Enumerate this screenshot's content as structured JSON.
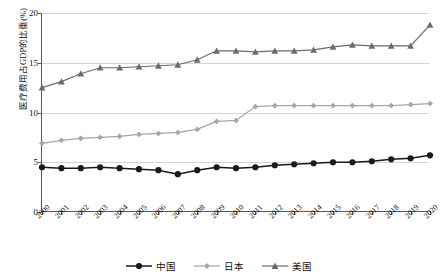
{
  "chart_data": {
    "type": "line",
    "title": "",
    "xlabel": "",
    "ylabel": "医疗费用占GDP的比重(%)",
    "ylim": [
      0,
      20
    ],
    "yticks": [
      0,
      5,
      10,
      15,
      20
    ],
    "grid": true,
    "legend_position": "bottom",
    "categories": [
      "2000",
      "2001",
      "2002",
      "2003",
      "2004",
      "2005",
      "2006",
      "2007",
      "2008",
      "2009",
      "2010",
      "2011",
      "2012",
      "2013",
      "2014",
      "2015",
      "2016",
      "2017",
      "2018",
      "2019",
      "2020"
    ],
    "series": [
      {
        "name": "中国",
        "color": "#1a1a1a",
        "marker": "circle",
        "values": [
          4.5,
          4.4,
          4.4,
          4.5,
          4.4,
          4.3,
          4.2,
          3.8,
          4.2,
          4.5,
          4.4,
          4.5,
          4.7,
          4.8,
          4.9,
          5.0,
          5.0,
          5.1,
          5.3,
          5.4,
          5.7
        ]
      },
      {
        "name": "日本",
        "color": "#a6a6a6",
        "marker": "diamond",
        "values": [
          6.9,
          7.2,
          7.4,
          7.5,
          7.6,
          7.8,
          7.9,
          8.0,
          8.3,
          9.1,
          9.2,
          10.6,
          10.7,
          10.7,
          10.7,
          10.7,
          10.7,
          10.7,
          10.7,
          10.8,
          10.9
        ]
      },
      {
        "name": "美国",
        "color": "#6b6b6b",
        "marker": "triangle",
        "values": [
          12.5,
          13.1,
          13.9,
          14.5,
          14.5,
          14.6,
          14.7,
          14.8,
          15.3,
          16.2,
          16.2,
          16.1,
          16.2,
          16.2,
          16.3,
          16.6,
          16.8,
          16.7,
          16.7,
          16.7,
          18.8
        ]
      }
    ]
  },
  "axis": {
    "y_title": "医疗费用占GDP的比重(%)",
    "y_tick_labels": [
      "0",
      "5",
      "10",
      "15",
      "20"
    ],
    "x_tick_labels": [
      "2000",
      "2001",
      "2002",
      "2003",
      "2004",
      "2005",
      "2006",
      "2007",
      "2008",
      "2009",
      "2010",
      "2011",
      "2012",
      "2013",
      "2014",
      "2015",
      "2016",
      "2017",
      "2018",
      "2019",
      "2020"
    ]
  },
  "legend": {
    "items": [
      {
        "label": "中国"
      },
      {
        "label": "日本"
      },
      {
        "label": "美国"
      }
    ]
  }
}
